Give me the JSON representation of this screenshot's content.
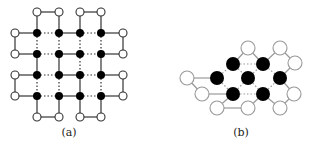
{
  "figure": {
    "panels": [
      {
        "id": "a",
        "label": "(a)",
        "label_pos": [
          69,
          136
        ],
        "open_nodes": [
          [
            37,
            12
          ],
          [
            59,
            12
          ],
          [
            80,
            12
          ],
          [
            101,
            12
          ],
          [
            15,
            33
          ],
          [
            123,
            33
          ],
          [
            15,
            54
          ],
          [
            123,
            54
          ],
          [
            15,
            75
          ],
          [
            123,
            75
          ],
          [
            15,
            96
          ],
          [
            123,
            96
          ],
          [
            37,
            117
          ],
          [
            59,
            117
          ],
          [
            80,
            117
          ],
          [
            101,
            117
          ]
        ],
        "filled_nodes": [
          [
            37,
            33
          ],
          [
            59,
            33
          ],
          [
            80,
            33
          ],
          [
            101,
            33
          ],
          [
            37,
            54
          ],
          [
            59,
            54
          ],
          [
            80,
            54
          ],
          [
            101,
            54
          ],
          [
            37,
            75
          ],
          [
            59,
            75
          ],
          [
            80,
            75
          ],
          [
            101,
            75
          ],
          [
            37,
            96
          ],
          [
            59,
            96
          ],
          [
            80,
            96
          ],
          [
            101,
            96
          ]
        ],
        "solid_edges": [
          [
            37,
            12,
            59,
            12
          ],
          [
            80,
            12,
            101,
            12
          ],
          [
            37,
            12,
            37,
            33
          ],
          [
            59,
            12,
            59,
            33
          ],
          [
            80,
            12,
            80,
            33
          ],
          [
            101,
            12,
            101,
            33
          ],
          [
            15,
            33,
            37,
            33
          ],
          [
            101,
            33,
            123,
            33
          ],
          [
            15,
            33,
            15,
            54
          ],
          [
            123,
            33,
            123,
            54
          ],
          [
            15,
            54,
            37,
            54
          ],
          [
            101,
            54,
            123,
            54
          ],
          [
            15,
            75,
            37,
            75
          ],
          [
            101,
            75,
            123,
            75
          ],
          [
            15,
            75,
            15,
            96
          ],
          [
            123,
            75,
            123,
            96
          ],
          [
            15,
            96,
            37,
            96
          ],
          [
            101,
            96,
            123,
            96
          ],
          [
            37,
            96,
            37,
            117
          ],
          [
            59,
            96,
            59,
            117
          ],
          [
            80,
            96,
            80,
            117
          ],
          [
            101,
            96,
            101,
            117
          ],
          [
            37,
            117,
            59,
            117
          ],
          [
            80,
            117,
            101,
            117
          ],
          [
            59,
            33,
            80,
            33
          ],
          [
            59,
            54,
            80,
            54
          ],
          [
            59,
            75,
            80,
            75
          ],
          [
            59,
            96,
            80,
            96
          ],
          [
            37,
            54,
            37,
            75
          ],
          [
            59,
            54,
            59,
            75
          ],
          [
            101,
            54,
            101,
            75
          ],
          [
            80,
            75,
            80,
            96
          ]
        ],
        "dotted_edges": [
          [
            37,
            33,
            59,
            33
          ],
          [
            80,
            33,
            101,
            33
          ],
          [
            37,
            54,
            59,
            54
          ],
          [
            80,
            54,
            101,
            54
          ],
          [
            37,
            75,
            59,
            75
          ],
          [
            80,
            75,
            101,
            75
          ],
          [
            37,
            96,
            59,
            96
          ],
          [
            80,
            96,
            101,
            96
          ],
          [
            37,
            33,
            37,
            54
          ],
          [
            59,
            33,
            59,
            54
          ],
          [
            80,
            33,
            80,
            54
          ],
          [
            101,
            33,
            101,
            54
          ],
          [
            80,
            54,
            80,
            75
          ],
          [
            37,
            75,
            37,
            96
          ],
          [
            59,
            75,
            59,
            96
          ],
          [
            101,
            75,
            101,
            96
          ]
        ]
      },
      {
        "id": "b",
        "label": "(b)",
        "label_pos": [
          241,
          136
        ],
        "open_nodes": [
          [
            248,
            48
          ],
          [
            280,
            48
          ],
          [
            295,
            63
          ],
          [
            187,
            78
          ],
          [
            202,
            94
          ],
          [
            217,
            108
          ],
          [
            248,
            108
          ],
          [
            280,
            108
          ],
          [
            294,
            94
          ]
        ],
        "filled_nodes": [
          [
            233,
            64
          ],
          [
            263,
            64
          ],
          [
            217,
            78
          ],
          [
            248,
            78
          ],
          [
            280,
            78
          ],
          [
            233,
            94
          ],
          [
            263,
            94
          ]
        ],
        "solid_edges": [
          [
            233,
            64,
            248,
            48
          ],
          [
            248,
            48,
            263,
            64
          ],
          [
            263,
            64,
            280,
            48
          ],
          [
            280,
            48,
            295,
            63
          ],
          [
            295,
            63,
            280,
            78
          ],
          [
            187,
            78,
            217,
            78
          ],
          [
            187,
            78,
            202,
            94
          ],
          [
            202,
            94,
            233,
            94
          ],
          [
            233,
            94,
            217,
            108
          ],
          [
            217,
            108,
            248,
            108
          ],
          [
            248,
            108,
            263,
            94
          ],
          [
            280,
            78,
            294,
            94
          ],
          [
            294,
            94,
            280,
            108
          ],
          [
            280,
            108,
            263,
            94
          ]
        ],
        "dotted_edges": [
          [
            233,
            64,
            263,
            64
          ],
          [
            233,
            94,
            263,
            94
          ],
          [
            217,
            78,
            233,
            64
          ],
          [
            233,
            64,
            248,
            78
          ],
          [
            248,
            78,
            263,
            64
          ],
          [
            263,
            64,
            280,
            78
          ],
          [
            217,
            78,
            233,
            94
          ],
          [
            233,
            94,
            248,
            78
          ],
          [
            248,
            78,
            263,
            94
          ],
          [
            263,
            94,
            280,
            78
          ]
        ]
      }
    ]
  },
  "style": {
    "node_radius_a": 4,
    "node_radius_b": 7,
    "filled_color": "#000000",
    "open_fill": "#ffffff",
    "edge_color_a": "#333333",
    "edge_color_b": "#999999"
  }
}
